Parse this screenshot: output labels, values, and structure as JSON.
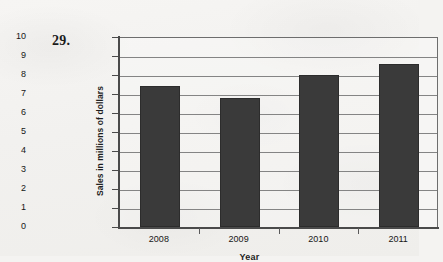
{
  "problem": {
    "number": "29."
  },
  "chart_data": {
    "type": "bar",
    "title": "",
    "subtitle": "",
    "xlabel": "Year",
    "ylabel": "Sales in millions of dollars",
    "categories": [
      "2008",
      "2009",
      "2010",
      "2011"
    ],
    "values": [
      7.4,
      6.8,
      8.0,
      8.6
    ],
    "series": [
      {
        "name": "Sales",
        "values": [
          7.4,
          6.8,
          8.0,
          8.6
        ]
      }
    ],
    "ylim": [
      0,
      10
    ],
    "xlim": [
      0,
      4
    ],
    "ytick_labels": [
      "0",
      "1",
      "2",
      "3",
      "4",
      "5",
      "6",
      "7",
      "8",
      "9",
      "10"
    ],
    "ytick_values": [
      0,
      1,
      2,
      3,
      4,
      5,
      6,
      7,
      8,
      9,
      10
    ],
    "xtick_labels": [
      "2008",
      "2009",
      "2010",
      "2011"
    ],
    "grid": true,
    "grid_axis": "y",
    "legend": false,
    "legend_position": "none",
    "bar_color": "#3a3a3a",
    "grid_color": "#848484",
    "axis_color": "#4a4a4a",
    "plot_background": "#f4f3f1"
  }
}
